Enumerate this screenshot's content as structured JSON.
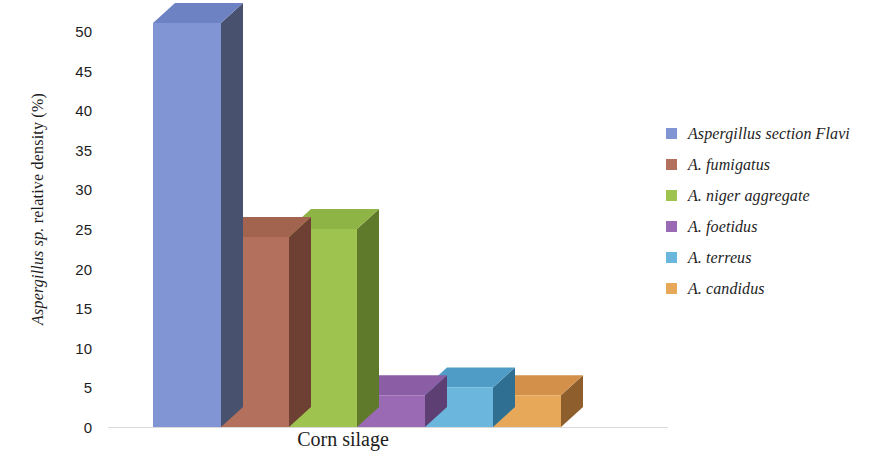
{
  "chart_data": {
    "type": "bar",
    "title": "",
    "subtitle": "",
    "xlabel": "Corn silage",
    "ylabel": "Aspergillus sp. relative density (%)",
    "ylabel_italic_part": "Aspergillus sp.",
    "ylabel_roman_part": " relative density (%)",
    "categories": [
      "Corn silage"
    ],
    "ylim": [
      0,
      50
    ],
    "yticks": [
      0,
      5,
      10,
      15,
      20,
      25,
      30,
      35,
      40,
      45,
      50
    ],
    "ytick_labels": [
      "0",
      "5",
      "10",
      "15",
      "20",
      "25",
      "30",
      "35",
      "40",
      "45",
      "50"
    ],
    "grid": false,
    "legend_position": "right",
    "style": "3d-column",
    "series": [
      {
        "name": "Aspergillus section Flavi",
        "values": [
          51
        ],
        "color": "#8195d4",
        "top_color": "#6d82c2",
        "side_color": "#48516e"
      },
      {
        "name": "A. fumigatus",
        "values": [
          24
        ],
        "color": "#b3705c",
        "top_color": "#a2644f",
        "side_color": "#6e3f33"
      },
      {
        "name": "A. niger aggregate",
        "values": [
          25
        ],
        "color": "#9ec44f",
        "top_color": "#8fb446",
        "side_color": "#5f7a2a"
      },
      {
        "name": "A. foetidus",
        "values": [
          4
        ],
        "color": "#9a6ab4",
        "top_color": "#8b5da5",
        "side_color": "#5d3f73"
      },
      {
        "name": "A. terreus",
        "values": [
          5
        ],
        "color": "#6ab6dd",
        "top_color": "#4f9dc6",
        "side_color": "#2f6f92"
      },
      {
        "name": "A. candidus",
        "values": [
          4
        ],
        "color": "#e8a85a",
        "top_color": "#d2904a",
        "side_color": "#8e5f2d"
      }
    ]
  },
  "legend": {
    "items": [
      {
        "label": "Aspergillus section Flavi",
        "color": "#8195d4"
      },
      {
        "label": "A. fumigatus",
        "color": "#b3705c"
      },
      {
        "label": "A. niger aggregate",
        "color": "#9ec44f"
      },
      {
        "label": "A. foetidus",
        "color": "#9a6ab4"
      },
      {
        "label": "A. terreus",
        "color": "#6ab6dd"
      },
      {
        "label": "A. candidus",
        "color": "#e8a85a"
      }
    ]
  },
  "axes": {
    "y_title_italic": "Aspergillus sp.",
    "y_title_rest": " relative density (%)",
    "x_title": "Corn silage"
  },
  "colors": {
    "background": "#ffffff",
    "text": "#1d1d1d",
    "baseline": "#d9d9d9"
  }
}
